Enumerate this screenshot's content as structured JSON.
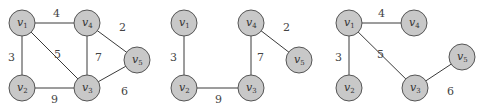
{
  "colors": {
    "node_fill": "#c8c8c8",
    "node_stroke": "#555555",
    "edge": "#3a3a3a",
    "text": "#333333"
  },
  "graphs": [
    {
      "id": "graph-full",
      "nodes": [
        {
          "id": "v1",
          "label": "v",
          "sub": "1",
          "x": 22,
          "y": 23
        },
        {
          "id": "v4",
          "label": "v",
          "sub": "4",
          "x": 87,
          "y": 23
        },
        {
          "id": "v5",
          "label": "v",
          "sub": "5",
          "x": 137,
          "y": 60
        },
        {
          "id": "v2",
          "label": "v",
          "sub": "2",
          "x": 22,
          "y": 88
        },
        {
          "id": "v3",
          "label": "v",
          "sub": "3",
          "x": 87,
          "y": 88
        }
      ],
      "edges": [
        {
          "from": "v1",
          "to": "v4",
          "weight": "4",
          "lx": 53,
          "ly": 17
        },
        {
          "from": "v1",
          "to": "v2",
          "weight": "3",
          "lx": 8,
          "ly": 61
        },
        {
          "from": "v1",
          "to": "v3",
          "weight": "5",
          "lx": 54,
          "ly": 58
        },
        {
          "from": "v4",
          "to": "v3",
          "weight": "7",
          "lx": 95,
          "ly": 61
        },
        {
          "from": "v4",
          "to": "v5",
          "weight": "2",
          "lx": 119,
          "ly": 31
        },
        {
          "from": "v2",
          "to": "v3",
          "weight": "9",
          "lx": 51,
          "ly": 103
        },
        {
          "from": "v3",
          "to": "v5",
          "weight": "6",
          "lx": 121,
          "ly": 95
        }
      ]
    },
    {
      "id": "graph-b",
      "nodes": [
        {
          "id": "v1",
          "label": "v",
          "sub": "1",
          "x": 184,
          "y": 23
        },
        {
          "id": "v4",
          "label": "v",
          "sub": "4",
          "x": 251,
          "y": 23
        },
        {
          "id": "v5",
          "label": "v",
          "sub": "5",
          "x": 299,
          "y": 60
        },
        {
          "id": "v2",
          "label": "v",
          "sub": "2",
          "x": 184,
          "y": 88
        },
        {
          "id": "v3",
          "label": "v",
          "sub": "3",
          "x": 251,
          "y": 88
        }
      ],
      "edges": [
        {
          "from": "v1",
          "to": "v2",
          "weight": "3",
          "lx": 170,
          "ly": 61
        },
        {
          "from": "v2",
          "to": "v3",
          "weight": "9",
          "lx": 215,
          "ly": 103
        },
        {
          "from": "v4",
          "to": "v3",
          "weight": "7",
          "lx": 257,
          "ly": 61
        },
        {
          "from": "v4",
          "to": "v5",
          "weight": "2",
          "lx": 283,
          "ly": 31
        }
      ]
    },
    {
      "id": "graph-c",
      "nodes": [
        {
          "id": "v1",
          "label": "v",
          "sub": "1",
          "x": 349,
          "y": 23
        },
        {
          "id": "v4",
          "label": "v",
          "sub": "4",
          "x": 414,
          "y": 23
        },
        {
          "id": "v5",
          "label": "v",
          "sub": "5",
          "x": 462,
          "y": 57
        },
        {
          "id": "v2",
          "label": "v",
          "sub": "2",
          "x": 349,
          "y": 88
        },
        {
          "id": "v3",
          "label": "v",
          "sub": "3",
          "x": 415,
          "y": 88
        }
      ],
      "edges": [
        {
          "from": "v1",
          "to": "v4",
          "weight": "4",
          "lx": 378,
          "ly": 17
        },
        {
          "from": "v1",
          "to": "v2",
          "weight": "3",
          "lx": 335,
          "ly": 61
        },
        {
          "from": "v1",
          "to": "v3",
          "weight": "5",
          "lx": 377,
          "ly": 58
        },
        {
          "from": "v3",
          "to": "v5",
          "weight": "6",
          "lx": 447,
          "ly": 95
        }
      ]
    }
  ]
}
